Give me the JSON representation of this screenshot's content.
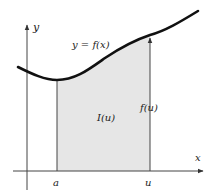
{
  "diagram": {
    "type": "integral-area-function",
    "colors": {
      "background": "#ffffff",
      "curve": "#111111",
      "axes": "#444444",
      "shade": "#e6e6e6",
      "text": "#222222"
    },
    "labels": {
      "y_axis": "y",
      "x_axis": "x",
      "curve": "y = f(x)",
      "area": "I(u)",
      "height": "f(u)",
      "lower_bound": "a",
      "upper_bound": "u"
    }
  }
}
